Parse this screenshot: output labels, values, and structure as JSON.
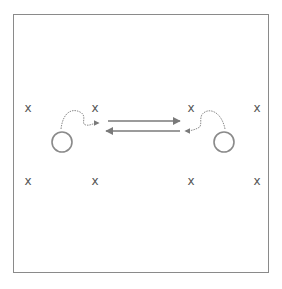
{
  "diagram": {
    "type": "drill-diagram",
    "colors": {
      "line": "#8a8a8a",
      "mark": "#555555",
      "arrow": "#7a7a7a"
    },
    "cones": [
      {
        "label": "x",
        "x": 28,
        "y": 108
      },
      {
        "label": "x",
        "x": 95,
        "y": 108
      },
      {
        "label": "x",
        "x": 191,
        "y": 108
      },
      {
        "label": "x",
        "x": 257,
        "y": 108
      },
      {
        "label": "x",
        "x": 28,
        "y": 181
      },
      {
        "label": "x",
        "x": 95,
        "y": 181
      },
      {
        "label": "x",
        "x": 191,
        "y": 181
      },
      {
        "label": "x",
        "x": 257,
        "y": 181
      }
    ],
    "players": [
      {
        "name": "player-left",
        "x": 62,
        "y": 142
      },
      {
        "name": "player-right",
        "x": 224,
        "y": 142
      }
    ],
    "passes": [
      {
        "direction": "left-to-right",
        "from": [
          108,
          121
        ],
        "to": [
          180,
          121
        ]
      },
      {
        "direction": "right-to-left",
        "from": [
          180,
          131
        ],
        "to": [
          106,
          131
        ]
      }
    ],
    "dribbles": [
      {
        "side": "left",
        "path": "M61,129 C63,112 72,108 80,112 C88,116 80,124 86,125 C90,126 93,123 99,123"
      },
      {
        "side": "right",
        "path": "M225,129 C222,114 212,108 205,112 C197,116 204,126 198,128 C194,130 190,131 185,131"
      }
    ]
  }
}
